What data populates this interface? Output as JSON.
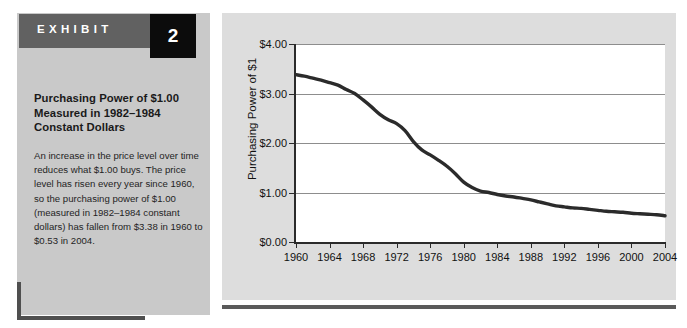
{
  "exhibit": {
    "header_label": "EXHIBIT",
    "number": "2",
    "title": "Purchasing Power of $1.00 Measured in 1982–1984 Constant Dollars",
    "body": "An increase in the price level over time reduces what $1.00 buys. The price level has risen every year since 1960, so the purchasing power of $1.00 (measured in 1982–1984 constant dollars) has fallen from $3.38 in 1960 to $0.53 in 2004."
  },
  "colors": {
    "panel_left_bg": "#c9c9c9",
    "panel_chart_bg": "#dddddd",
    "header_bar": "#616161",
    "number_box": "#0c0c0c",
    "rule": "#4f4f4f",
    "plot_bg": "#ffffff",
    "axis": "#2b2b2b",
    "gridline": "#8d8d8d",
    "series_line": "#2b2b2b"
  },
  "chart_data": {
    "type": "line",
    "title": "",
    "xlabel": "",
    "ylabel": "Purchasing Power of $1",
    "xlim": [
      1960,
      2004
    ],
    "ylim": [
      0,
      4
    ],
    "grid": true,
    "legend": "none",
    "ytick_labels": [
      "$0.00",
      "$1.00",
      "$2.00",
      "$3.00",
      "$4.00"
    ],
    "ytick_values": [
      0,
      1,
      2,
      3,
      4
    ],
    "xtick_labels": [
      "1960",
      "1964",
      "1968",
      "1972",
      "1976",
      "1980",
      "1984",
      "1988",
      "1992",
      "1996",
      "2000",
      "2004"
    ],
    "xtick_values": [
      1960,
      1964,
      1968,
      1972,
      1976,
      1980,
      1984,
      1988,
      1992,
      1996,
      2000,
      2004
    ],
    "series": [
      {
        "name": "Purchasing Power of $1.00 (1982–1984 dollars)",
        "x": [
          1960,
          1961,
          1962,
          1963,
          1964,
          1965,
          1966,
          1967,
          1968,
          1969,
          1970,
          1971,
          1972,
          1973,
          1974,
          1975,
          1976,
          1977,
          1978,
          1979,
          1980,
          1981,
          1982,
          1983,
          1984,
          1985,
          1986,
          1987,
          1988,
          1989,
          1990,
          1991,
          1992,
          1993,
          1994,
          1995,
          1996,
          1997,
          1998,
          1999,
          2000,
          2001,
          2002,
          2003,
          2004
        ],
        "values": [
          3.38,
          3.35,
          3.31,
          3.27,
          3.22,
          3.17,
          3.08,
          3.0,
          2.87,
          2.73,
          2.58,
          2.47,
          2.39,
          2.25,
          2.03,
          1.86,
          1.76,
          1.65,
          1.53,
          1.38,
          1.21,
          1.1,
          1.03,
          1.0,
          0.96,
          0.93,
          0.91,
          0.88,
          0.85,
          0.81,
          0.77,
          0.73,
          0.71,
          0.69,
          0.68,
          0.66,
          0.64,
          0.62,
          0.61,
          0.6,
          0.58,
          0.57,
          0.56,
          0.55,
          0.53
        ]
      }
    ]
  }
}
